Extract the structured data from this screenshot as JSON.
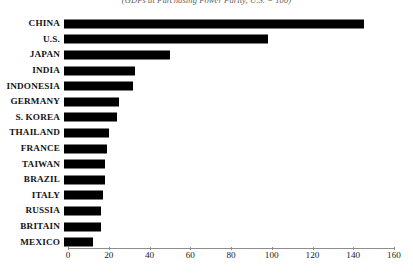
{
  "chart_data": {
    "type": "bar",
    "orientation": "horizontal",
    "title": "",
    "subtitle": "(GDPs at Purchasing Power Parity, U.S. = 100)",
    "xlabel": "",
    "ylabel": "",
    "xlim": [
      0,
      160
    ],
    "xticks": [
      0,
      20,
      40,
      60,
      80,
      100,
      120,
      140,
      160
    ],
    "xtick_labels": [
      "0",
      "20",
      "40",
      "60",
      "80",
      "100",
      "120",
      "140",
      "160"
    ],
    "grid": false,
    "legend": false,
    "bar_color": "#000000",
    "categories": [
      "CHINA",
      "U.S.",
      "JAPAN",
      "INDIA",
      "INDONESIA",
      "GERMANY",
      "S. KOREA",
      "THAILAND",
      "FRANCE",
      "TAIWAN",
      "BRAZIL",
      "ITALY",
      "RUSSIA",
      "BRITAIN",
      "MEXICO"
    ],
    "values": [
      147,
      100,
      52,
      35,
      34,
      27,
      26,
      22,
      21,
      20,
      20,
      19,
      18,
      18,
      14
    ]
  }
}
